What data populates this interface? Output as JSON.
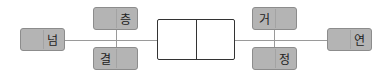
{
  "diagram": {
    "type": "word-puzzle-connector",
    "center_box": {
      "cells": [
        "",
        ""
      ]
    },
    "tiles": {
      "left_outer": {
        "label": "넘"
      },
      "left_top": {
        "label": "층"
      },
      "left_bottom": {
        "label": "결"
      },
      "right_top": {
        "label": "거"
      },
      "right_bottom": {
        "label": "정"
      },
      "right_outer": {
        "label": "연"
      }
    },
    "colors": {
      "tile_fill": "#b4b4b4",
      "tile_border": "#8c8c8c",
      "line": "#9a9a9a",
      "center_border": "#333333"
    }
  }
}
